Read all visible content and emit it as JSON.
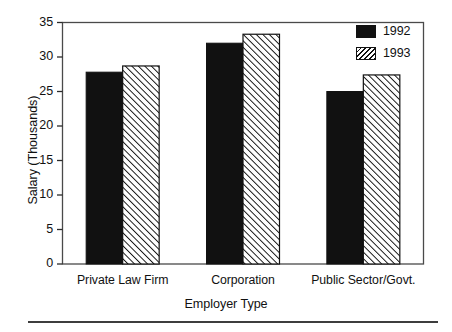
{
  "chart_data": {
    "type": "bar",
    "title": "",
    "xlabel": "Employer Type",
    "ylabel": "Salary (Thousands)",
    "categories": [
      "Private Law Firm",
      "Corporation",
      "Public Sector/Govt."
    ],
    "series": [
      {
        "name": "1992",
        "values": [
          27.8,
          32.0,
          25.0
        ],
        "fill": "solid",
        "color": "#111111"
      },
      {
        "name": "1993",
        "values": [
          28.7,
          33.3,
          27.4
        ],
        "fill": "hatch-forward",
        "color": "#111111"
      }
    ],
    "ylim": [
      0,
      35
    ],
    "yticks": [
      0,
      5,
      10,
      15,
      20,
      25,
      30,
      35
    ],
    "ytick_labels": [
      "0",
      "5",
      "10",
      "15",
      "20",
      "25",
      "30",
      "35"
    ],
    "grid": false,
    "legend_position": "top-right",
    "legend_entries": [
      "1992",
      "1993"
    ]
  }
}
